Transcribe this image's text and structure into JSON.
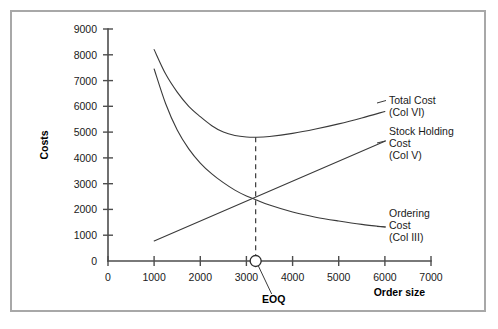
{
  "figure": {
    "frame_color": "#a8a8a8",
    "background": "#ffffff"
  },
  "chart_data": {
    "type": "line",
    "title": "",
    "xlabel": "Order size",
    "ylabel": "Costs",
    "xlim": [
      0,
      7000
    ],
    "ylim": [
      0,
      9000
    ],
    "xticks": [
      0,
      1000,
      2000,
      3000,
      4000,
      5000,
      6000,
      7000
    ],
    "yticks": [
      0,
      1000,
      2000,
      3000,
      4000,
      5000,
      6000,
      7000,
      8000,
      9000
    ],
    "xtick_labels": [
      "0",
      "1000",
      "2000",
      "3000",
      "4000",
      "5000",
      "6000",
      "7000"
    ],
    "ytick_labels": [
      "0",
      "1000",
      "2000",
      "3000",
      "4000",
      "5000",
      "6000",
      "7000",
      "8000",
      "9000"
    ],
    "grid": false,
    "legend_position": "right-inline-labels",
    "series": [
      {
        "name": "Total Cost (Col VI)",
        "label_lines": [
          "Total Cost",
          "(Col VI)"
        ],
        "color": "#3a3a3a",
        "x": [
          1000,
          1250,
          1500,
          1750,
          2000,
          2250,
          2500,
          2750,
          3000,
          3200,
          3500,
          4000,
          4500,
          5000,
          5500,
          6000
        ],
        "y": [
          8200,
          7250,
          6550,
          6000,
          5600,
          5250,
          5000,
          4870,
          4810,
          4800,
          4830,
          4950,
          5120,
          5320,
          5550,
          5800
        ]
      },
      {
        "name": "Ordering Cost (Col III)",
        "label_lines": [
          "Ordering",
          "Cost",
          "(Col III)"
        ],
        "color": "#3a3a3a",
        "x": [
          1000,
          1250,
          1500,
          1750,
          2000,
          2250,
          2500,
          2750,
          3000,
          3200,
          3500,
          4000,
          4500,
          5000,
          5500,
          6000
        ],
        "y": [
          7450,
          6100,
          5080,
          4350,
          3800,
          3380,
          3040,
          2750,
          2520,
          2380,
          2170,
          1900,
          1700,
          1550,
          1420,
          1320
        ]
      },
      {
        "name": "Stock Holding Cost (Col V)",
        "label_lines": [
          "Stock Holding",
          "Cost",
          "(Col V)"
        ],
        "color": "#3a3a3a",
        "x": [
          1000,
          6000
        ],
        "y": [
          780,
          4650
        ]
      }
    ],
    "annotations": [
      {
        "name": "eoq-marker",
        "label": "EOQ",
        "x": 3200,
        "y": 0,
        "marker": "open-circle",
        "drop_line_to": 4800
      }
    ]
  },
  "labels": {
    "y_axis_title": "Costs",
    "x_axis_title": "Order size",
    "total_cost_line1": "Total Cost",
    "total_cost_line2": "(Col VI)",
    "stock_holding_line1": "Stock Holding",
    "stock_holding_line2": "Cost",
    "stock_holding_line3": "(Col V)",
    "ordering_line1": "Ordering",
    "ordering_line2": "Cost",
    "ordering_line3": "(Col III)",
    "eoq": "EOQ",
    "y0": "0",
    "y1000": "1000",
    "y2000": "2000",
    "y3000": "3000",
    "y4000": "4000",
    "y5000": "5000",
    "y6000": "6000",
    "y7000": "7000",
    "y8000": "8000",
    "y9000": "9000",
    "x0": "0",
    "x1000": "1000",
    "x2000": "2000",
    "x3000": "3000",
    "x4000": "4000",
    "x5000": "5000",
    "x6000": "6000",
    "x7000": "7000"
  }
}
